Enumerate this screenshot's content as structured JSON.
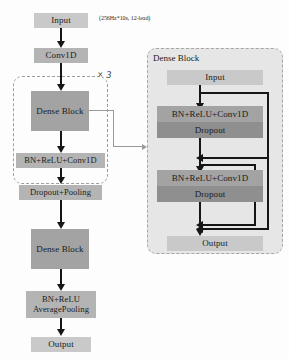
{
  "figure": {
    "type": "diagram",
    "annotation_input_spec": "(256Hz*10s, 12-lead)",
    "repeat_label": "× 3"
  },
  "main_flow": {
    "nodes": [
      {
        "id": "input",
        "label": "Input"
      },
      {
        "id": "conv1d",
        "label": "Conv1D"
      },
      {
        "id": "dense_block_1",
        "label": "Dense Block"
      },
      {
        "id": "bn_relu_conv",
        "label": "BN+ReLU+Conv1D"
      },
      {
        "id": "dropout_pool",
        "label": "Dropout+Pooling"
      },
      {
        "id": "dense_block_2",
        "label": "Dense Block"
      },
      {
        "id": "bn_relu_avgpool",
        "label": "BN+ReLU\nAveragePooling"
      },
      {
        "id": "output",
        "label": "Output"
      }
    ]
  },
  "dense_block_panel": {
    "title": "Dense Block",
    "nodes": [
      {
        "id": "db_input",
        "label": "Input"
      },
      {
        "id": "db_layer1",
        "label": "BN+ReLU+Conv1D"
      },
      {
        "id": "db_dropout1",
        "label": "Dropout"
      },
      {
        "id": "db_layer2",
        "label": "BN+ReLU+Conv1D"
      },
      {
        "id": "db_dropout2",
        "label": "Dropout"
      },
      {
        "id": "db_output",
        "label": "Output"
      }
    ]
  },
  "colors": {
    "box_light": "#c9c9c9",
    "box_mid": "#b4b4b4",
    "box_dark": "#a3a3a3",
    "box_deep": "#8f8f8f",
    "panel_fill": "#e6e6e6",
    "stroke": "#161616",
    "dashed_stroke": "#9d9d9d"
  }
}
